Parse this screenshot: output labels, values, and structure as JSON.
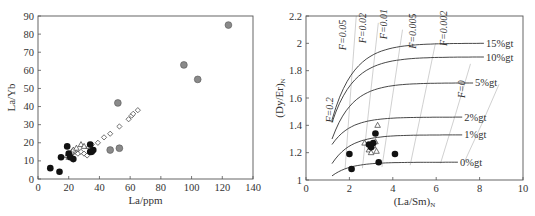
{
  "chart_data": [
    {
      "type": "scatter",
      "title": "",
      "xlabel": "La/ppm",
      "ylabel": "La/Yb",
      "xlim": [
        0,
        140
      ],
      "ylim": [
        0,
        90
      ],
      "xticks": [
        0,
        20,
        40,
        60,
        80,
        100,
        120,
        140
      ],
      "yticks": [
        0,
        10,
        20,
        30,
        40,
        50,
        60,
        70,
        80,
        90
      ],
      "grid": false,
      "legend": "none",
      "series": [
        {
          "name": "black-filled-circles",
          "marker": "circle-filled-black",
          "points": [
            [
              8,
              6
            ],
            [
              14,
              4
            ],
            [
              15,
              12
            ],
            [
              19,
              18
            ],
            [
              20,
              14
            ],
            [
              21,
              12
            ],
            [
              23,
              11
            ],
            [
              34,
              15
            ],
            [
              35,
              15
            ],
            [
              36,
              16
            ],
            [
              34,
              19
            ]
          ]
        },
        {
          "name": "grey-filled-circles",
          "marker": "circle-filled-grey",
          "points": [
            [
              47,
              16
            ],
            [
              52,
              42
            ],
            [
              53,
              17
            ],
            [
              95,
              63
            ],
            [
              104,
              55
            ],
            [
              124,
              85
            ]
          ]
        },
        {
          "name": "open-diamonds",
          "marker": "diamond-open",
          "points": [
            [
              22,
              14
            ],
            [
              24,
              15
            ],
            [
              26,
              14
            ],
            [
              28,
              15
            ],
            [
              30,
              14
            ],
            [
              32,
              13
            ],
            [
              35,
              19
            ],
            [
              39,
              20
            ],
            [
              43,
              23
            ],
            [
              47,
              25
            ],
            [
              53,
              29
            ],
            [
              59,
              33
            ],
            [
              61,
              35
            ],
            [
              62,
              36
            ],
            [
              65,
              38
            ]
          ]
        },
        {
          "name": "open-triangles",
          "marker": "triangle-open",
          "points": [
            [
              19,
              13
            ],
            [
              20,
              12
            ],
            [
              21,
              14
            ],
            [
              22,
              15
            ],
            [
              23,
              16
            ],
            [
              25,
              17
            ],
            [
              28,
              19
            ],
            [
              30,
              18
            ],
            [
              33,
              18
            ]
          ]
        }
      ]
    },
    {
      "type": "line+scatter",
      "title": "",
      "xlabel": "(La/Sm)N",
      "ylabel": "(Dy/Er)N",
      "xlabel_parts": {
        "main": "(La/Sm)",
        "sub": "N"
      },
      "ylabel_parts": {
        "main": "(Dy/Er)",
        "sub": "N"
      },
      "xlim": [
        0,
        10
      ],
      "ylim": [
        1,
        2.2
      ],
      "xticks": [
        0,
        2,
        4,
        6,
        8,
        10
      ],
      "yticks": [
        1,
        1.2,
        1.4,
        1.6,
        1.8,
        2,
        2.2
      ],
      "grid": false,
      "melting_curves": [
        {
          "label": "15%gt",
          "end_x": 8.2,
          "end_y": 2.0
        },
        {
          "label": "10%gt",
          "end_x": 8.2,
          "end_y": 1.9
        },
        {
          "label": "5%gt",
          "end_x": 7.7,
          "end_y": 1.71
        },
        {
          "label": "2%gt",
          "end_x": 7.2,
          "end_y": 1.46
        },
        {
          "label": "1%gt",
          "end_x": 7.2,
          "end_y": 1.33
        },
        {
          "label": "0%gt",
          "end_x": 7.0,
          "end_y": 1.13
        }
      ],
      "melt_fraction_contours": [
        {
          "label": "F=0.2",
          "x_approx": 1.1
        },
        {
          "label": "F=0.05",
          "x_approx": 1.8
        },
        {
          "label": "F=0.02",
          "x_approx": 2.6
        },
        {
          "label": "F=0.01",
          "x_approx": 3.5
        },
        {
          "label": "F=0.005",
          "x_approx": 4.8
        },
        {
          "label": "F=0.002",
          "x_approx": 6.2
        },
        {
          "label": "F=0",
          "x_approx": 7.3
        }
      ],
      "series": [
        {
          "name": "black-filled-circles",
          "marker": "circle-filled-black",
          "points": [
            [
              2.0,
              1.19
            ],
            [
              2.1,
              1.08
            ],
            [
              2.9,
              1.26
            ],
            [
              3.0,
              1.24
            ],
            [
              3.1,
              1.27
            ],
            [
              3.2,
              1.34
            ],
            [
              3.35,
              1.13
            ],
            [
              4.1,
              1.19
            ]
          ]
        },
        {
          "name": "open-triangles",
          "marker": "triangle-open",
          "points": [
            [
              2.7,
              1.27
            ],
            [
              2.9,
              1.22
            ],
            [
              3.0,
              1.2
            ],
            [
              3.1,
              1.25
            ],
            [
              3.2,
              1.28
            ],
            [
              3.3,
              1.4
            ],
            [
              3.25,
              1.21
            ]
          ]
        }
      ]
    }
  ]
}
